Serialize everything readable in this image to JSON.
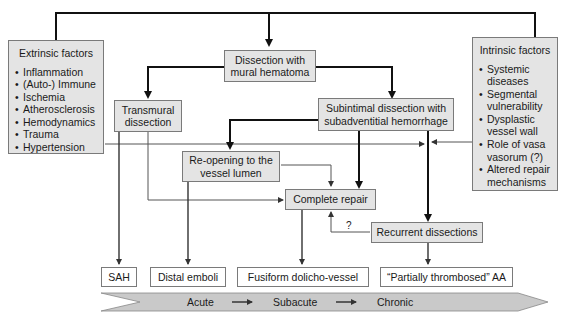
{
  "diagram": {
    "extrinsic": {
      "title": "Extrinsic factors",
      "items": [
        "Inflammation",
        "(Auto-) Immune",
        "Ischemia",
        "Atherosclerosis",
        "Hemodynamics",
        "Trauma",
        "Hypertension"
      ]
    },
    "intrinsic": {
      "title": "Intrinsic factors",
      "items": [
        "Systemic diseases",
        "Segmental vulnerability",
        "Dysplastic vessel wall",
        "Role of vasa vasorum (?)",
        "Altered repair mechanisms"
      ]
    },
    "nodes": {
      "dissection": "Dissection with mural hematoma",
      "transmural": "Transmural dissection",
      "subintimal": "Subintimal dissection with subadventitial hemorrhage",
      "reopening": "Re-opening to the vessel lumen",
      "repair": "Complete repair",
      "recurrent": "Recurrent dissections",
      "question_mark": "?"
    },
    "outcomes": {
      "sah": "SAH",
      "emboli": "Distal emboli",
      "fusiform": "Fusiform dolicho-vessel",
      "thrombosed": "“Partially thrombosed” AA"
    },
    "timeline": {
      "acute": "Acute",
      "subacute": "Subacute",
      "chronic": "Chronic"
    }
  }
}
